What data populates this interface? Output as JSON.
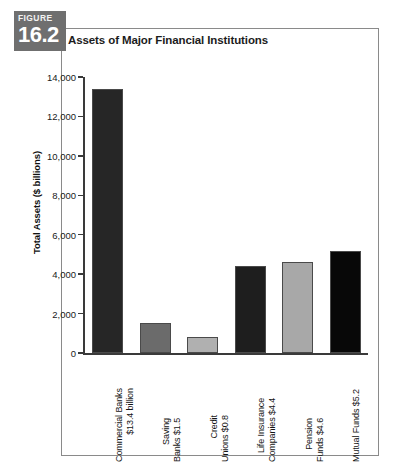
{
  "badge": {
    "word": "FIGURE",
    "number": "16.2",
    "color": "#6f6f6f"
  },
  "title": "Assets of Major Financial Institutions",
  "chart_data": {
    "type": "bar",
    "title": "Assets of Major Financial Institutions",
    "xlabel": "",
    "ylabel": "Total Assets ($ billions)",
    "ylim": [
      0,
      14000
    ],
    "yticks": [
      0,
      2000,
      4000,
      6000,
      8000,
      10000,
      12000,
      14000
    ],
    "ytick_labels": [
      "0",
      "2,000",
      "4,000",
      "6,000",
      "8,000",
      "10,000",
      "12,000",
      "14,000"
    ],
    "grid": false,
    "legend": "none",
    "categories": [
      "Commercial Banks",
      "Saving Banks",
      "Credit Unions",
      "Life Insurance Companies",
      "Pension Funds",
      "Mutual Funds"
    ],
    "values": [
      13400,
      1500,
      800,
      4400,
      4600,
      5200
    ],
    "bar_colors": [
      "#262626",
      "#6b6b6b",
      "#b0b0b0",
      "#1e1e1e",
      "#a8a8a8",
      "#080808"
    ],
    "data_labels": [
      "$13.4 billion",
      "$1.5",
      "$0.8",
      "$4.4",
      "$4.6",
      "$5.2"
    ],
    "tick_labels_x": [
      {
        "line1": "Commercial Banks",
        "line2": "$13.4 billion"
      },
      {
        "line1": "Saving",
        "line2": "Banks $1.5"
      },
      {
        "line1": "Credit",
        "line2": "Unions $0.8"
      },
      {
        "line1": "Life Insurance",
        "line2": "Companies $4.4"
      },
      {
        "line1": "Pension",
        "line2": "Funds $4.6"
      },
      {
        "line1": "Mutual Funds $5.2",
        "line2": ""
      }
    ]
  }
}
